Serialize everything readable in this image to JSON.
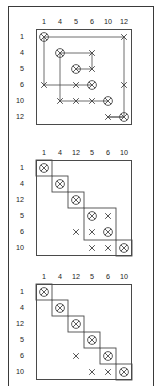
{
  "figure": {
    "title": "",
    "panel_count": 3,
    "mark_legend": {
      "circled-x": "circled-cross marker (diagonal / clustered element)",
      "x": "cross marker (dependency mark)"
    },
    "colors": {
      "ink": "#1a1a1a",
      "line": "#4a4a4a",
      "frame": "#3a3a3a",
      "background": "#ffffff"
    }
  },
  "panels": [
    {
      "id": "panel-1",
      "name": "dsm-with-routing",
      "col_labels": [
        "1",
        "4",
        "5",
        "6",
        "10",
        "12"
      ],
      "row_labels": [
        "1",
        "4",
        "5",
        "6",
        "10",
        "12"
      ],
      "circled_cells": [
        {
          "r": 0,
          "c": 0
        },
        {
          "r": 1,
          "c": 1
        },
        {
          "r": 2,
          "c": 2
        },
        {
          "r": 3,
          "c": 3
        },
        {
          "r": 4,
          "c": 4
        },
        {
          "r": 5,
          "c": 5
        }
      ],
      "cross_cells": [
        {
          "r": 0,
          "c": 5
        },
        {
          "r": 1,
          "c": 3
        },
        {
          "r": 2,
          "c": 3
        },
        {
          "r": 3,
          "c": 0
        },
        {
          "r": 3,
          "c": 2
        },
        {
          "r": 3,
          "c": 5
        },
        {
          "r": 4,
          "c": 1
        },
        {
          "r": 4,
          "c": 2
        },
        {
          "r": 4,
          "c": 3
        },
        {
          "r": 5,
          "c": 4
        }
      ],
      "routes": [
        {
          "from": {
            "r": 0,
            "c": 0
          },
          "to": {
            "r": 0,
            "c": 5
          }
        },
        {
          "from": {
            "r": 0,
            "c": 0
          },
          "to": {
            "r": 3,
            "c": 0
          }
        },
        {
          "from": {
            "r": 1,
            "c": 1
          },
          "to": {
            "r": 1,
            "c": 3
          }
        },
        {
          "from": {
            "r": 1,
            "c": 1
          },
          "to": {
            "r": 4,
            "c": 1
          }
        },
        {
          "from": {
            "r": 2,
            "c": 2
          },
          "to": {
            "r": 2,
            "c": 3
          }
        },
        {
          "from": {
            "r": 3,
            "c": 3
          },
          "to": {
            "r": 3,
            "c": 0
          }
        },
        {
          "from": {
            "r": 4,
            "c": 4
          },
          "to": {
            "r": 4,
            "c": 1
          }
        },
        {
          "from": {
            "r": 5,
            "c": 5
          },
          "to": {
            "r": 5,
            "c": 4
          }
        },
        {
          "from": {
            "r": 0,
            "c": 5
          },
          "to": {
            "r": 3,
            "c": 5
          }
        },
        {
          "from": {
            "r": 1,
            "c": 3
          },
          "to": {
            "r": 2,
            "c": 3
          }
        },
        {
          "from": {
            "r": 3,
            "c": 5
          },
          "to": {
            "r": 5,
            "c": 4
          }
        }
      ]
    },
    {
      "id": "panel-2",
      "name": "dsm-partitioned-clusters",
      "col_labels": [
        "1",
        "4",
        "12",
        "5",
        "6",
        "10"
      ],
      "row_labels": [
        "1",
        "4",
        "12",
        "5",
        "6",
        "10"
      ],
      "circled_cells": [
        {
          "r": 0,
          "c": 0
        },
        {
          "r": 1,
          "c": 1
        },
        {
          "r": 2,
          "c": 2
        },
        {
          "r": 3,
          "c": 3
        },
        {
          "r": 4,
          "c": 4
        },
        {
          "r": 5,
          "c": 5
        }
      ],
      "cross_cells": [
        {
          "r": 3,
          "c": 4
        },
        {
          "r": 4,
          "c": 2
        },
        {
          "r": 4,
          "c": 3
        },
        {
          "r": 5,
          "c": 3
        },
        {
          "r": 5,
          "c": 4
        }
      ],
      "blocks": [
        {
          "r0": 0,
          "c0": 0,
          "r1": 0,
          "c1": 0
        },
        {
          "r0": 1,
          "c0": 1,
          "r1": 1,
          "c1": 1
        },
        {
          "r0": 2,
          "c0": 2,
          "r1": 2,
          "c1": 2
        },
        {
          "r0": 3,
          "c0": 3,
          "r1": 4,
          "c1": 4
        },
        {
          "r0": 5,
          "c0": 5,
          "r1": 5,
          "c1": 5
        }
      ]
    },
    {
      "id": "panel-3",
      "name": "dsm-fully-sequenced",
      "col_labels": [
        "1",
        "4",
        "12",
        "5",
        "6",
        "10"
      ],
      "row_labels": [
        "1",
        "4",
        "12",
        "5",
        "6",
        "10"
      ],
      "circled_cells": [
        {
          "r": 0,
          "c": 0
        },
        {
          "r": 1,
          "c": 1
        },
        {
          "r": 2,
          "c": 2
        },
        {
          "r": 3,
          "c": 3
        },
        {
          "r": 4,
          "c": 4
        },
        {
          "r": 5,
          "c": 5
        }
      ],
      "cross_cells": [
        {
          "r": 4,
          "c": 2
        },
        {
          "r": 5,
          "c": 3
        },
        {
          "r": 5,
          "c": 4
        }
      ],
      "blocks": [
        {
          "r0": 0,
          "c0": 0,
          "r1": 0,
          "c1": 0
        },
        {
          "r0": 1,
          "c0": 1,
          "r1": 1,
          "c1": 1
        },
        {
          "r0": 2,
          "c0": 2,
          "r1": 2,
          "c1": 2
        },
        {
          "r0": 3,
          "c0": 3,
          "r1": 3,
          "c1": 3
        },
        {
          "r0": 4,
          "c0": 4,
          "r1": 4,
          "c1": 4
        },
        {
          "r0": 5,
          "c0": 5,
          "r1": 5,
          "c1": 5
        }
      ]
    }
  ],
  "geometry": {
    "panel_origins": [
      {
        "x": 36,
        "y": 29
      },
      {
        "x": 36,
        "y": 160
      },
      {
        "x": 36,
        "y": 284
      }
    ],
    "cell": 16,
    "header_offset": 11,
    "row_header_offset": 12
  }
}
